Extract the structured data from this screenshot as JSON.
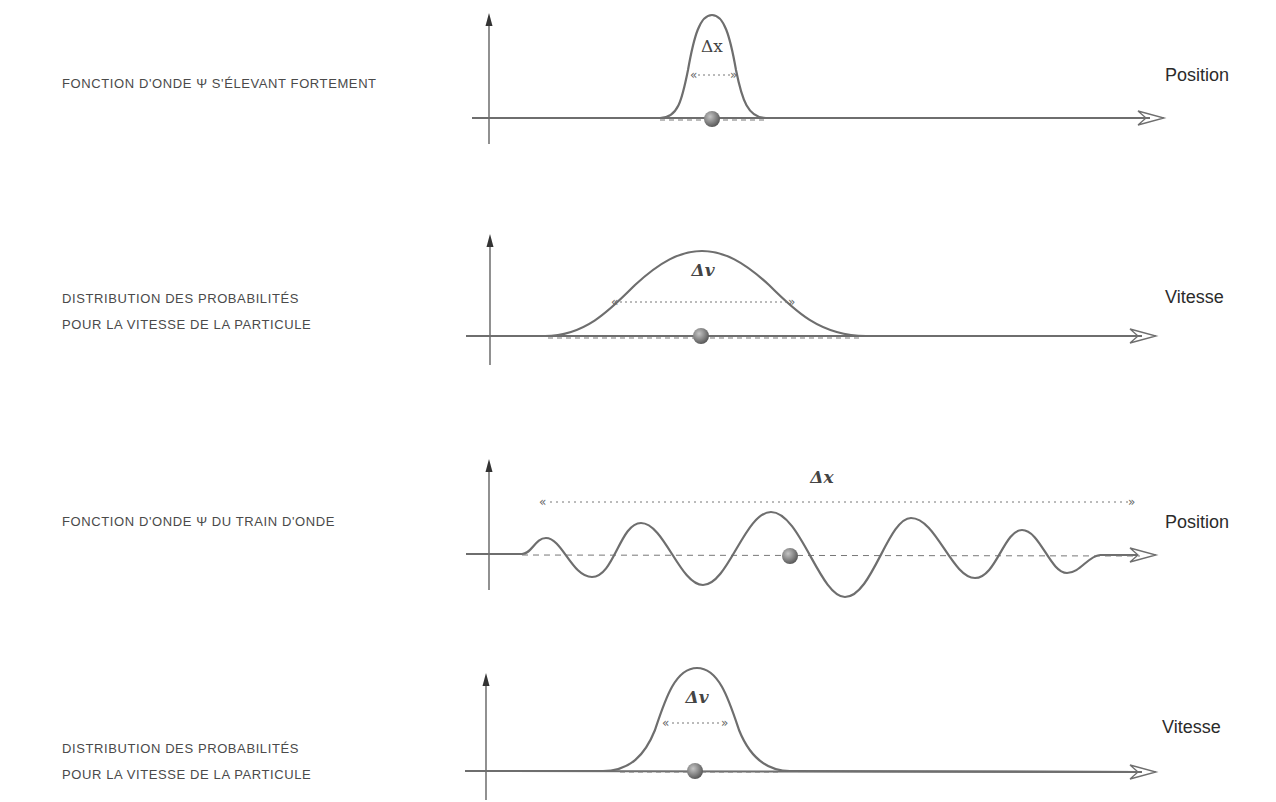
{
  "panels": [
    {
      "caption_lines": [
        "Fonction d'onde Ψ s'élevant fortement"
      ],
      "axis_label": "Position",
      "delta_label": "Δx",
      "curve": "narrow-gaussian",
      "x_axis_meaning": "position"
    },
    {
      "caption_lines": [
        "Distribution des probabilités",
        "pour la vitesse de la particule"
      ],
      "axis_label": "Vitesse",
      "delta_label": "Δv",
      "curve": "wide-gaussian",
      "x_axis_meaning": "velocity"
    },
    {
      "caption_lines": [
        "Fonction d'onde Ψ du train d'onde"
      ],
      "axis_label": "Position",
      "delta_label": "Δx",
      "curve": "wave-train",
      "x_axis_meaning": "position"
    },
    {
      "caption_lines": [
        "Distribution des probabilités",
        "pour la vitesse de la particule"
      ],
      "axis_label": "Vitesse",
      "delta_label": "Δv",
      "curve": "narrow-gaussian",
      "x_axis_meaning": "velocity"
    }
  ],
  "colors": {
    "curve": "#6e6e6e",
    "axis": "#555555",
    "dashed": "#777777",
    "particle": "#8a8a8a",
    "text": "#3a3a3a"
  }
}
